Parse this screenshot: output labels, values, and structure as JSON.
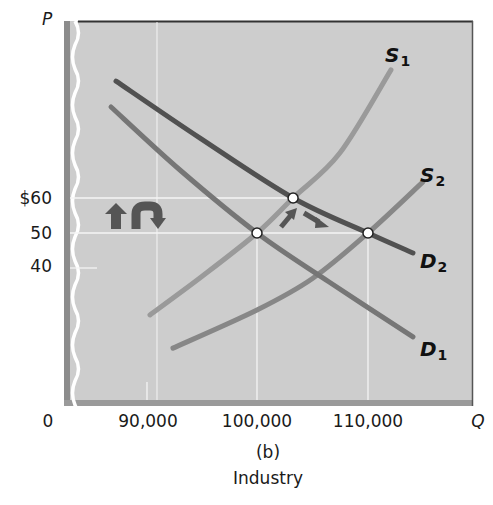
{
  "axes": {
    "y_name": "P",
    "x_name": "Q",
    "origin": "0",
    "y_ticks": [
      {
        "label": "$60",
        "value": 60
      },
      {
        "label": "50",
        "value": 50
      },
      {
        "label": "40",
        "value": 40
      }
    ],
    "x_ticks": [
      {
        "label": "90,000",
        "value": 90000
      },
      {
        "label": "100,000",
        "value": 100000
      },
      {
        "label": "110,000",
        "value": 110000
      }
    ]
  },
  "figure": {
    "panel_label": "(b)",
    "caption": "Industry"
  },
  "curve_labels": {
    "S1": {
      "letter": "S",
      "sub": "1"
    },
    "S2": {
      "letter": "S",
      "sub": "2"
    },
    "D1": {
      "letter": "D",
      "sub": "1"
    },
    "D2": {
      "letter": "D",
      "sub": "2"
    }
  },
  "colors": {
    "plot_bg": "#cdcdcd",
    "D2": "#515151",
    "D1": "#767676",
    "S1": "#9a9a9a",
    "S2": "#878787",
    "arrows": "#555555",
    "grid": "#f4f4f4"
  },
  "chart_data": {
    "type": "line",
    "title": "",
    "subtitle": "(b) Industry",
    "xlabel": "Q",
    "ylabel": "P",
    "xlim": [
      80000,
      118000
    ],
    "ylim": [
      0,
      100
    ],
    "grid": false,
    "legend": "inline curve labels",
    "x_ticks": [
      0,
      90000,
      100000,
      110000
    ],
    "y_ticks": [
      40,
      50,
      60
    ],
    "series": [
      {
        "name": "D2",
        "points": [
          [
            87300,
            93.4
          ],
          [
            94870,
            77.1
          ],
          [
            103250,
            60
          ],
          [
            110000,
            50
          ],
          [
            114050,
            44.3
          ]
        ]
      },
      {
        "name": "D1",
        "points": [
          [
            86850,
            86
          ],
          [
            93060,
            68
          ],
          [
            100000,
            50
          ],
          [
            106500,
            36
          ],
          [
            114050,
            20.3
          ]
        ]
      },
      {
        "name": "S1",
        "points": [
          [
            90360,
            26.6
          ],
          [
            95000,
            37.5
          ],
          [
            100000,
            50
          ],
          [
            103250,
            60
          ],
          [
            107480,
            72.9
          ],
          [
            112070,
            96.6
          ]
        ]
      },
      {
        "name": "S2",
        "points": [
          [
            92430,
            17.1
          ],
          [
            100000,
            28
          ],
          [
            105000,
            37
          ],
          [
            110000,
            50
          ],
          [
            114950,
            64.6
          ]
        ]
      }
    ],
    "equilibrium_points": [
      {
        "label": "D1∩S1",
        "q": 100000,
        "p": 50
      },
      {
        "label": "D2∩S1",
        "q": 103250,
        "p": 60
      },
      {
        "label": "D2∩S2",
        "q": 110000,
        "p": 50
      }
    ],
    "annotations": [
      "price rises from $50 to $60 then returns to $50 (up arrow and curved down arrow)",
      "movement arrows from (100,000, $50) toward (103,250, $60) and on to (110,000, $50)"
    ]
  }
}
